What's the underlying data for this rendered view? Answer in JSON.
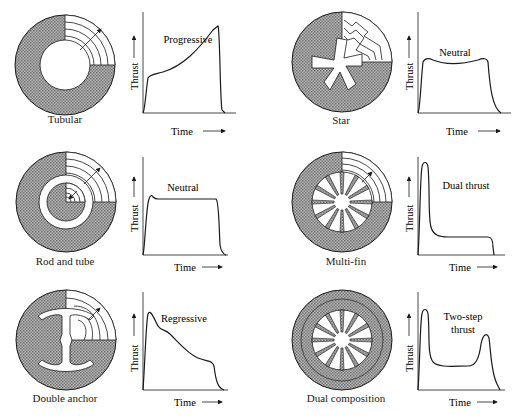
{
  "figure": {
    "colors": {
      "propellant": "#8a8a8a",
      "ink": "#1a1a1a",
      "background": "#ffffff"
    },
    "axis": {
      "ylabel": "Thrust",
      "xlabel": "Time"
    },
    "panels": [
      {
        "grain": "Tubular",
        "curve_label": "Progressive",
        "profile": "progressive"
      },
      {
        "grain": "Star",
        "curve_label": "Neutral",
        "profile": "neutral"
      },
      {
        "grain": "Rod and tube",
        "curve_label": "Neutral",
        "profile": "neutral"
      },
      {
        "grain": "Multi-fin",
        "curve_label": "Dual thrust",
        "profile": "dual-thrust"
      },
      {
        "grain": "Double anchor",
        "curve_label": "Regressive",
        "profile": "regressive"
      },
      {
        "grain": "Dual composition",
        "curve_label_line1": "Two-step",
        "curve_label_line2": "thrust",
        "profile": "two-step"
      }
    ]
  }
}
